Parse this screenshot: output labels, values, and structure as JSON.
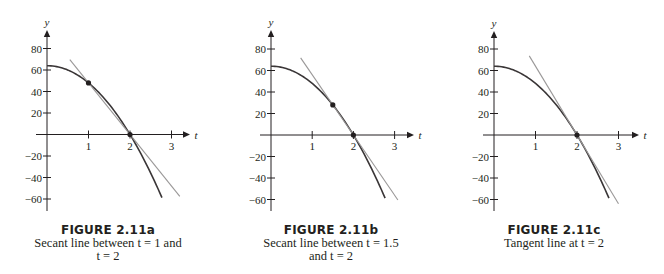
{
  "chart_data": [
    {
      "type": "line",
      "id": "fig-2-11a",
      "title": "FIGURE 2.11a",
      "caption_lines": [
        "Secant line between t = 1 and",
        "t = 2"
      ],
      "xlabel": "t",
      "ylabel": "y",
      "xticks": [
        1,
        2,
        3
      ],
      "yticks": [
        80,
        60,
        40,
        20,
        -20,
        -40,
        -60
      ],
      "xlim": [
        0,
        3.3
      ],
      "ylim": [
        -70,
        95
      ],
      "grid": false,
      "series": [
        {
          "name": "curve y = 64 - 16t^2",
          "kind": "curve",
          "t_range": [
            0,
            2.77
          ],
          "x": [
            0,
            0.5,
            1,
            1.5,
            2,
            2.5,
            2.77
          ],
          "values": [
            64,
            60,
            48,
            28,
            0,
            -36,
            -58.8
          ]
        },
        {
          "name": "secant line",
          "kind": "line",
          "x": [
            0.55,
            3.2
          ],
          "values": [
            69.6,
            -57.6
          ]
        }
      ],
      "points": [
        {
          "x": 1,
          "y": 48
        },
        {
          "x": 2,
          "y": 0
        }
      ]
    },
    {
      "type": "line",
      "id": "fig-2-11b",
      "title": "FIGURE 2.11b",
      "caption_lines": [
        "Secant line between t = 1.5",
        "and t = 2"
      ],
      "xlabel": "t",
      "ylabel": "y",
      "xticks": [
        1,
        2,
        3
      ],
      "yticks": [
        80,
        60,
        40,
        20,
        -20,
        -40,
        -60
      ],
      "xlim": [
        0,
        3.3
      ],
      "ylim": [
        -70,
        95
      ],
      "grid": false,
      "series": [
        {
          "name": "curve y = 64 - 16t^2",
          "kind": "curve",
          "t_range": [
            0,
            2.77
          ],
          "x": [
            0,
            0.5,
            1,
            1.5,
            2,
            2.5,
            2.77
          ],
          "values": [
            64,
            60,
            48,
            28,
            0,
            -36,
            -58.8
          ]
        },
        {
          "name": "secant line",
          "kind": "line",
          "x": [
            0.72,
            3.08
          ],
          "values": [
            71.7,
            -60.5
          ]
        }
      ],
      "points": [
        {
          "x": 1.5,
          "y": 28
        },
        {
          "x": 2,
          "y": 0
        }
      ]
    },
    {
      "type": "line",
      "id": "fig-2-11c",
      "title": "FIGURE 2.11c",
      "caption_lines": [
        "Tangent line at t = 2"
      ],
      "xlabel": "t",
      "ylabel": "y",
      "xticks": [
        1,
        2,
        3
      ],
      "yticks": [
        80,
        60,
        40,
        20,
        -20,
        -40,
        -60
      ],
      "xlim": [
        0,
        3.3
      ],
      "ylim": [
        -70,
        95
      ],
      "grid": false,
      "series": [
        {
          "name": "curve y = 64 - 16t^2",
          "kind": "curve",
          "t_range": [
            0,
            2.77
          ],
          "x": [
            0,
            0.5,
            1,
            1.5,
            2,
            2.5,
            2.77
          ],
          "values": [
            64,
            60,
            48,
            28,
            0,
            -36,
            -58.8
          ]
        },
        {
          "name": "tangent line",
          "kind": "line",
          "x": [
            0.85,
            3.0
          ],
          "values": [
            73.6,
            -64
          ]
        }
      ],
      "points": [
        {
          "x": 2,
          "y": 0
        }
      ]
    }
  ],
  "figures": [
    {
      "title": "FIGURE 2.11a",
      "line1": "Secant line between t = 1 and",
      "line2": "t = 2"
    },
    {
      "title": "FIGURE 2.11b",
      "line1": "Secant line between t = 1.5",
      "line2": "and t = 2"
    },
    {
      "title": "FIGURE 2.11c",
      "line1": "Tangent line at t = 2",
      "line2": ""
    }
  ],
  "layout": {
    "panels": [
      {
        "origin_x": 47,
        "origin_y": 134.5,
        "px_per_t": 41.5,
        "px_per_y": 1.075,
        "axis_right": 190,
        "axis_top": 30,
        "axis_bottom": 211
      },
      {
        "origin_x": 271,
        "origin_y": 135,
        "px_per_t": 41.2,
        "px_per_y": 1.075,
        "axis_right": 414,
        "axis_top": 30,
        "axis_bottom": 211
      },
      {
        "origin_x": 494,
        "origin_y": 135,
        "px_per_t": 41.5,
        "px_per_y": 1.075,
        "axis_right": 639,
        "axis_top": 31,
        "axis_bottom": 211
      }
    ],
    "colors": {
      "axis": "#231f20",
      "curve": "#3a3637",
      "secant": "#9a9898",
      "text": "#231f20"
    }
  }
}
